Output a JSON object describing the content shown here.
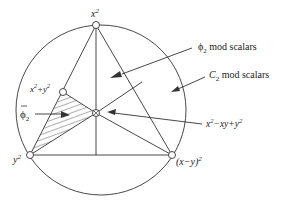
{
  "diagram": {
    "title": "",
    "labels": {
      "top_vertex": "x",
      "top_vertex_sup": "2",
      "upper_left_point": "x",
      "upper_left_point_sup1": "2",
      "upper_left_point_mid": "+y",
      "upper_left_point_sup2": "2",
      "phi2_bar": "ϕ",
      "phi2_bar_sub": "2",
      "bottom_left_vertex": "y",
      "bottom_left_vertex_sup": "2",
      "bottom_right_vertex": "(x−y)",
      "bottom_right_vertex_sup": "2",
      "center_point": "x",
      "center_point_sup1": "2",
      "center_point_mid": "−xy+y",
      "center_point_sup2": "2",
      "phi2_region": "ϕ",
      "phi2_region_sub": "2",
      "phi2_region_text": " mod scalars",
      "c2_region": "C",
      "c2_region_sub": "2",
      "c2_region_text": " mod scalars"
    },
    "colors": {
      "stroke": "#333333",
      "hatch": "#333333",
      "background": "#ffffff"
    }
  }
}
